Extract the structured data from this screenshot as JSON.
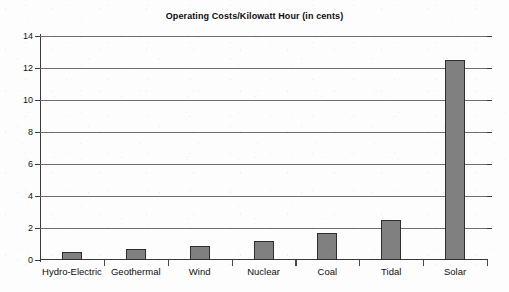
{
  "chart_data": {
    "type": "bar",
    "title": "Operating Costs/Kilowatt Hour (in cents)",
    "xlabel": "",
    "ylabel": "",
    "categories": [
      "Hydro-Electric",
      "Geothermal",
      "Wind",
      "Nuclear",
      "Coal",
      "Tidal",
      "Solar"
    ],
    "values": [
      0.5,
      0.7,
      0.9,
      1.2,
      1.7,
      2.5,
      12.5
    ],
    "ylim": [
      0,
      14
    ],
    "ytick_labels": [
      "0",
      "2",
      "4",
      "6",
      "8",
      "10",
      "12",
      "14"
    ],
    "ytick_values": [
      0,
      2,
      4,
      6,
      8,
      10,
      12,
      14
    ],
    "grid": true,
    "legend": false,
    "legend_position": "none",
    "bar_color": "#808080",
    "bar_edge_color": "#2e2e2e",
    "axis_color": "#3a3a3a",
    "gridline_color": "#6e6e6e",
    "background_color": "#fdfdfd",
    "title_color": "#0d0d0d"
  }
}
